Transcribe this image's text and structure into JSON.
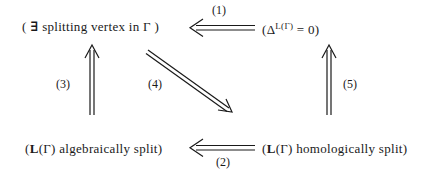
{
  "diagram": {
    "nodes": {
      "top_left": {
        "open": "(",
        "exists": "∃",
        "text": "splitting vertex in",
        "gamma": "Γ",
        "close": ")"
      },
      "top_right": {
        "open": "(Δ",
        "sup": "L(Γ)",
        "rest": "= 0)"
      },
      "bottom_left": {
        "L": "L",
        "gamma": "(Γ)",
        "text": "algebraically split)",
        "open": "("
      },
      "bottom_right": {
        "L": "L",
        "gamma": "(Γ)",
        "text": "homologically split)",
        "open": "("
      }
    },
    "arrows": [
      {
        "id": 1,
        "label": "(1)",
        "from": "top_right",
        "to": "top_left"
      },
      {
        "id": 2,
        "label": "(2)",
        "from": "bottom_right",
        "to": "bottom_left"
      },
      {
        "id": 3,
        "label": "(3)",
        "from": "bottom_left",
        "to": "top_left"
      },
      {
        "id": 4,
        "label": "(4)",
        "from": "top_left",
        "to": "bottom_right"
      },
      {
        "id": 5,
        "label": "(5)",
        "from": "bottom_right",
        "to": "top_right"
      }
    ]
  }
}
